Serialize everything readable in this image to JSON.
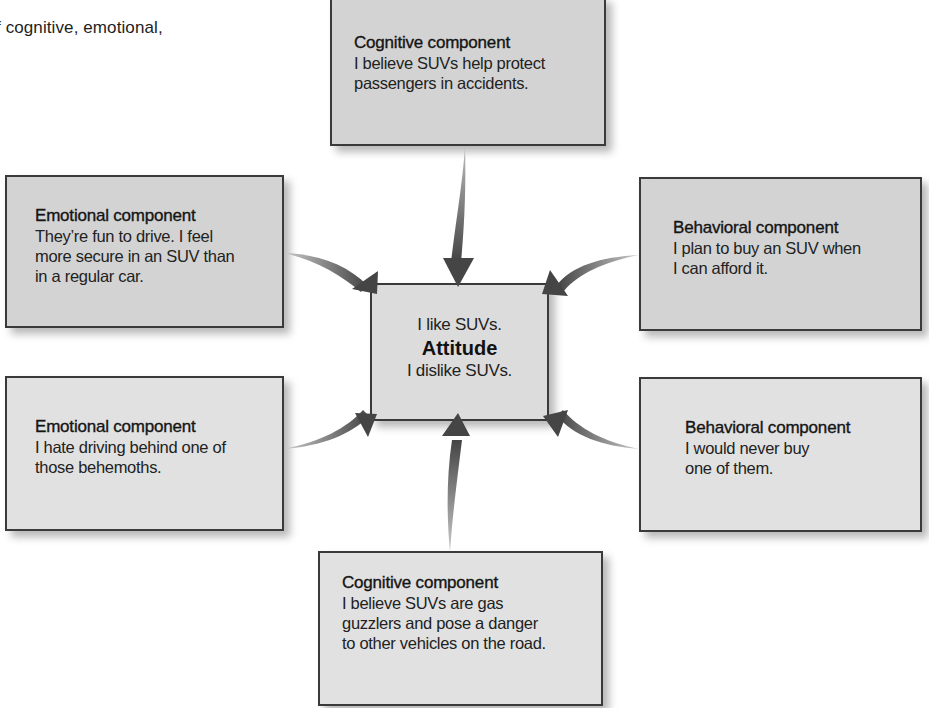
{
  "page": {
    "intro_text_fragment": "f cognitive, emotional,"
  },
  "diagram": {
    "center": {
      "top_line": "I like SUVs.",
      "title": "Attitude",
      "bottom_line": "I dislike SUVs."
    },
    "components": [
      {
        "id": "cognitive-positive",
        "title": "Cognitive component",
        "lines": [
          "I believe SUVs help protect",
          "passengers in accidents."
        ],
        "shade": "#d3d3d3"
      },
      {
        "id": "emotional-positive",
        "title": "Emotional component",
        "lines": [
          "They’re fun to drive. I feel",
          "more secure in an SUV than",
          "in a regular car."
        ],
        "shade": "#d3d3d3"
      },
      {
        "id": "behavioral-positive",
        "title": "Behavioral component",
        "lines": [
          "I plan to buy an SUV when",
          "I can afford it."
        ],
        "shade": "#d3d3d3"
      },
      {
        "id": "emotional-negative",
        "title": "Emotional component",
        "lines": [
          "I hate driving behind one of",
          "those behemoths."
        ],
        "shade": "#e1e1e1"
      },
      {
        "id": "behavioral-negative",
        "title": "Behavioral component",
        "lines": [
          "I would never buy",
          "one of them."
        ],
        "shade": "#e1e1e1"
      },
      {
        "id": "cognitive-negative",
        "title": "Cognitive component",
        "lines": [
          "I believe SUVs are gas",
          "guzzlers and pose a danger",
          "to other vehicles on the road."
        ],
        "shade": "#e1e1e1"
      }
    ],
    "arrows": [
      {
        "from": "cognitive-positive",
        "to": "center",
        "direction": "down"
      },
      {
        "from": "emotional-positive",
        "to": "center",
        "direction": "down-right"
      },
      {
        "from": "behavioral-positive",
        "to": "center",
        "direction": "down-left"
      },
      {
        "from": "emotional-negative",
        "to": "center",
        "direction": "up-right"
      },
      {
        "from": "behavioral-negative",
        "to": "center",
        "direction": "up-left"
      },
      {
        "from": "cognitive-negative",
        "to": "center",
        "direction": "up"
      }
    ],
    "colors": {
      "box_positive": "#d3d3d3",
      "box_negative": "#e1e1e1",
      "border": "#3a3a3a",
      "arrow": "#4a4a4a"
    }
  }
}
